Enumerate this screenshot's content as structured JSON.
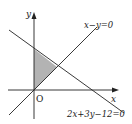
{
  "diagram": {
    "type": "coordinate-plane-feasible-region",
    "axes": {
      "x_label": "x",
      "y_label": "y",
      "origin_label": "O"
    },
    "lines": [
      {
        "id": "line-1",
        "equation": "x−y=0"
      },
      {
        "id": "line-2",
        "equation": "2x+3y−12=0"
      }
    ],
    "shaded_region": {
      "vertices": [
        [
          0,
          0
        ],
        [
          0,
          4
        ],
        [
          2.4,
          2.4
        ]
      ],
      "fill": "#b3b3b3"
    },
    "colors": {
      "line": "#222222",
      "shade": "#b3b3b3",
      "background": "#ffffff"
    }
  }
}
